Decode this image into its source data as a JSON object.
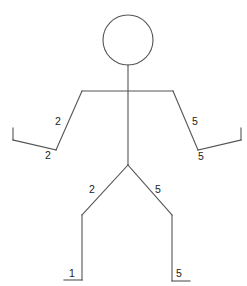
{
  "figure": {
    "line_color": "#555555",
    "text_color": "#222222",
    "head": {
      "cx": 128,
      "cy": 40,
      "r": 25
    },
    "segments": {
      "neck_spine": [
        128,
        65,
        128,
        165
      ],
      "shoulders": [
        82,
        91,
        173,
        91
      ],
      "left_upper_arm": [
        82,
        91,
        56,
        150
      ],
      "left_forearm": [
        56,
        150,
        13,
        140
      ],
      "left_hand": [
        13,
        140,
        13,
        128
      ],
      "right_upper_arm": [
        173,
        91,
        198,
        150
      ],
      "right_forearm": [
        198,
        150,
        241,
        140
      ],
      "right_hand": [
        241,
        140,
        241,
        128
      ],
      "left_thigh": [
        128,
        165,
        82,
        215
      ],
      "left_shin": [
        82,
        215,
        82,
        280
      ],
      "left_foot": [
        82,
        280,
        64,
        280
      ],
      "right_thigh": [
        128,
        165,
        172,
        215
      ],
      "right_shin": [
        172,
        215,
        172,
        281
      ],
      "right_foot": [
        172,
        281,
        190,
        281
      ]
    },
    "labels": {
      "left_upper_arm": "2",
      "left_forearm": "2",
      "right_upper_arm": "5",
      "right_forearm": "5",
      "left_thigh": "2",
      "left_foot": "1",
      "right_thigh": "5",
      "right_foot": "5"
    }
  }
}
